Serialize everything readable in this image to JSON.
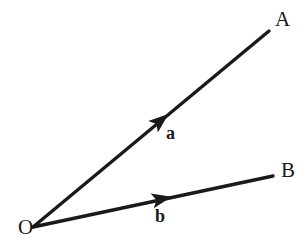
{
  "figure": {
    "background_color": "#ffffff",
    "stroke_color": "#1a1a1a",
    "width": 308,
    "height": 250
  },
  "points": {
    "origin": {
      "label": "O",
      "x": 33,
      "y": 227,
      "label_x": 18,
      "label_y": 234
    },
    "a_tip": {
      "label": "A",
      "x": 269,
      "y": 31,
      "label_x": 275,
      "label_y": 26
    },
    "b_tip": {
      "label": "B",
      "x": 273,
      "y": 176,
      "label_x": 281,
      "label_y": 177
    }
  },
  "vectors": [
    {
      "name": "vector-a",
      "label": "a",
      "from": "O",
      "to": "A",
      "x1": 33,
      "y1": 227,
      "x2": 269,
      "y2": 31,
      "arrow_x": 160,
      "arrow_y": 121,
      "label_x": 166,
      "label_y": 139,
      "stroke_width": 3.4
    },
    {
      "name": "vector-b",
      "label": "b",
      "from": "O",
      "to": "B",
      "x1": 33,
      "y1": 227,
      "x2": 273,
      "y2": 176,
      "arrow_x": 161,
      "arrow_y": 199,
      "label_x": 155,
      "label_y": 222,
      "stroke_width": 3.4
    }
  ]
}
